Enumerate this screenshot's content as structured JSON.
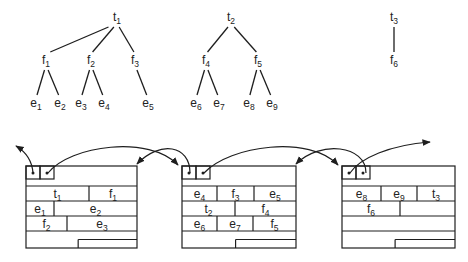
{
  "trees": [
    {
      "id": "t1",
      "root": {
        "base": "t",
        "sub": "1",
        "x": 117,
        "y": 21
      },
      "children": [
        {
          "base": "f",
          "sub": "1",
          "x": 46,
          "y": 64,
          "children": [
            {
              "base": "e",
              "sub": "1",
              "x": 36,
              "y": 107
            },
            {
              "base": "e",
              "sub": "2",
              "x": 60,
              "y": 107
            }
          ]
        },
        {
          "base": "f",
          "sub": "2",
          "x": 91,
          "y": 64,
          "children": [
            {
              "base": "e",
              "sub": "3",
              "x": 81,
              "y": 107
            },
            {
              "base": "e",
              "sub": "4",
              "x": 104,
              "y": 107
            }
          ]
        },
        {
          "base": "f",
          "sub": "3",
          "x": 135,
          "y": 64,
          "children": [
            {
              "base": "e",
              "sub": "5",
              "x": 148,
              "y": 107
            }
          ]
        }
      ]
    },
    {
      "id": "t2",
      "root": {
        "base": "t",
        "sub": "2",
        "x": 231,
        "y": 21
      },
      "children": [
        {
          "base": "f",
          "sub": "4",
          "x": 206,
          "y": 64,
          "children": [
            {
              "base": "e",
              "sub": "6",
              "x": 196,
              "y": 107
            },
            {
              "base": "e",
              "sub": "7",
              "x": 219,
              "y": 107
            }
          ]
        },
        {
          "base": "f",
          "sub": "5",
          "x": 258,
          "y": 64,
          "children": [
            {
              "base": "e",
              "sub": "8",
              "x": 249,
              "y": 107
            },
            {
              "base": "e",
              "sub": "9",
              "x": 272,
              "y": 107
            }
          ]
        }
      ]
    },
    {
      "id": "t3",
      "root": {
        "base": "t",
        "sub": "3",
        "x": 394,
        "y": 21
      },
      "children": [
        {
          "base": "f",
          "sub": "6",
          "x": 394,
          "y": 64,
          "children": []
        }
      ]
    }
  ],
  "pages": [
    {
      "x": 26,
      "y": 166,
      "w": 111,
      "h": 82,
      "rows": [
        {
          "cells": [
            {
              "base": "t",
              "sub": "1",
              "w": 63
            },
            {
              "base": "f",
              "sub": "1",
              "w": 48
            }
          ]
        },
        {
          "cells": [
            {
              "base": "e",
              "sub": "1",
              "w": 28
            },
            {
              "base": "e",
              "sub": "2",
              "w": 83
            }
          ]
        },
        {
          "cells": [
            {
              "base": "f",
              "sub": "2",
              "w": 41
            },
            {
              "base": "e",
              "sub": "3",
              "w": 70
            }
          ]
        }
      ],
      "empty_rows": 0
    },
    {
      "x": 182,
      "y": 166,
      "w": 114,
      "h": 82,
      "rows": [
        {
          "cells": [
            {
              "base": "e",
              "sub": "4",
              "w": 35
            },
            {
              "base": "f",
              "sub": "3",
              "w": 37
            },
            {
              "base": "e",
              "sub": "5",
              "w": 42
            }
          ]
        },
        {
          "cells": [
            {
              "base": "t",
              "sub": "2",
              "w": 53
            },
            {
              "base": "f",
              "sub": "4",
              "w": 61
            }
          ]
        },
        {
          "cells": [
            {
              "base": "e",
              "sub": "6",
              "w": 35
            },
            {
              "base": "e",
              "sub": "7",
              "w": 36
            },
            {
              "base": "f",
              "sub": "5",
              "w": 43
            }
          ]
        }
      ],
      "empty_rows": 0
    },
    {
      "x": 342,
      "y": 166,
      "w": 113,
      "h": 82,
      "rows": [
        {
          "cells": [
            {
              "base": "e",
              "sub": "8",
              "w": 39
            },
            {
              "base": "e",
              "sub": "9",
              "w": 36
            },
            {
              "base": "t",
              "sub": "3",
              "w": 38
            }
          ]
        },
        {
          "cells": [
            {
              "base": "f",
              "sub": "6",
              "w": 58
            },
            {
              "base": "",
              "sub": "",
              "w": 55
            }
          ]
        }
      ],
      "empty_rows": 1
    }
  ],
  "colors": {
    "line": "#1e1e1e",
    "text": "#222222",
    "background": "#ffffff"
  }
}
